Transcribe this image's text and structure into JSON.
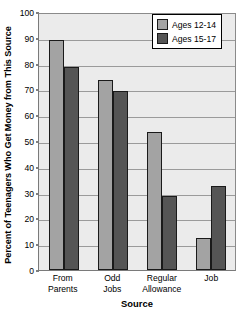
{
  "chart_data": {
    "type": "bar",
    "title": "",
    "xlabel": "Source",
    "ylabel": "Percent of Teenagers Who Get Money from This Source",
    "categories": [
      "From Parents",
      "Odd Jobs",
      "Regular Allowance",
      "Job"
    ],
    "category_lines": [
      [
        "From",
        "Parents"
      ],
      [
        "Odd",
        "Jobs"
      ],
      [
        "Regular",
        "Allowance"
      ],
      [
        "Job"
      ]
    ],
    "series": [
      {
        "name": "Ages 12-14",
        "color": "#a3a3a3",
        "values": [
          89,
          73.5,
          53.5,
          12.5
        ]
      },
      {
        "name": "Ages 15-17",
        "color": "#555555",
        "values": [
          78.5,
          69.5,
          28.5,
          32.5
        ]
      }
    ],
    "ylim": [
      0,
      100
    ],
    "yticks": [
      0,
      10,
      20,
      30,
      40,
      50,
      60,
      70,
      80,
      90,
      100
    ],
    "ytick_labels": [
      "0",
      "10",
      "20",
      "30",
      "40",
      "50",
      "60",
      "70",
      "80",
      "90",
      "100"
    ],
    "grid": true,
    "grid_axis": "y",
    "legend_position": "top-right",
    "plot_background": "#ebebeb",
    "gridline_color": "#9a9a9a",
    "bar_edge_color": "#1a1a1a"
  }
}
